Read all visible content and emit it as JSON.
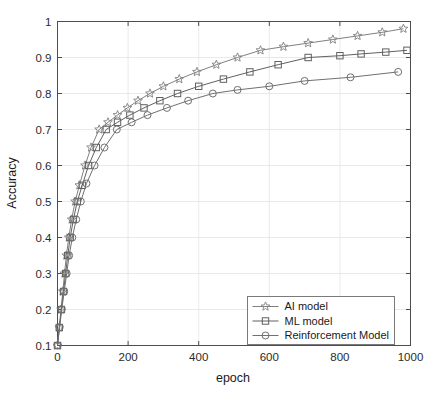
{
  "chart_data": {
    "type": "line",
    "title": "",
    "xlabel": "epoch",
    "ylabel": "Accuracy",
    "xlim": [
      0,
      1000
    ],
    "ylim": [
      0.1,
      1.0
    ],
    "xticks": [
      0,
      200,
      400,
      600,
      800,
      1000
    ],
    "xtick_labels": [
      "0",
      "200",
      "400",
      "600",
      "800",
      "1000"
    ],
    "yticks": [
      0.1,
      0.2,
      0.3,
      0.4,
      0.5,
      0.6,
      0.7,
      0.8,
      0.9,
      1.0
    ],
    "ytick_labels": [
      "0.1",
      "0.2",
      "0.3",
      "0.4",
      "0.5",
      "0.6",
      "0.7",
      "0.8",
      "0.9",
      "1"
    ],
    "grid": true,
    "legend_position": "lower right",
    "series": [
      {
        "name": "AI model",
        "marker": "star",
        "color": "#808080",
        "x": [
          0,
          5,
          10,
          15,
          20,
          25,
          32,
          40,
          50,
          62,
          78,
          95,
          118,
          143,
          170,
          198,
          228,
          262,
          300,
          345,
          395,
          450,
          510,
          575,
          640,
          710,
          780,
          850,
          920,
          980
        ],
        "values": [
          0.1,
          0.15,
          0.2,
          0.25,
          0.3,
          0.35,
          0.4,
          0.45,
          0.5,
          0.545,
          0.6,
          0.65,
          0.7,
          0.72,
          0.74,
          0.76,
          0.78,
          0.8,
          0.82,
          0.84,
          0.86,
          0.88,
          0.9,
          0.92,
          0.93,
          0.94,
          0.95,
          0.96,
          0.97,
          0.98
        ]
      },
      {
        "name": "ML model",
        "marker": "square",
        "color": "#606060",
        "x": [
          0,
          5,
          11,
          17,
          23,
          29,
          36,
          45,
          56,
          70,
          88,
          110,
          138,
          170,
          205,
          245,
          290,
          340,
          400,
          470,
          545,
          625,
          710,
          800,
          860,
          930,
          990
        ],
        "values": [
          0.1,
          0.15,
          0.2,
          0.25,
          0.3,
          0.35,
          0.4,
          0.45,
          0.5,
          0.545,
          0.6,
          0.65,
          0.7,
          0.72,
          0.74,
          0.76,
          0.78,
          0.8,
          0.82,
          0.84,
          0.86,
          0.88,
          0.9,
          0.905,
          0.91,
          0.915,
          0.92
        ]
      },
      {
        "name": "Reinforcement Model",
        "marker": "circle",
        "color": "#707070",
        "x": [
          0,
          6,
          12,
          19,
          26,
          33,
          42,
          53,
          66,
          82,
          105,
          133,
          168,
          210,
          255,
          310,
          370,
          440,
          510,
          600,
          700,
          830,
          965
        ],
        "values": [
          0.1,
          0.15,
          0.2,
          0.25,
          0.3,
          0.35,
          0.4,
          0.45,
          0.5,
          0.55,
          0.6,
          0.65,
          0.7,
          0.72,
          0.74,
          0.76,
          0.78,
          0.8,
          0.81,
          0.82,
          0.835,
          0.845,
          0.86
        ]
      }
    ]
  },
  "legend": {
    "entries": [
      {
        "label": "AI model"
      },
      {
        "label": "ML model"
      },
      {
        "label": "Reinforcement Model"
      }
    ]
  },
  "colors": {
    "axis": "#4d4d4d",
    "grid": "#e3e3e3",
    "background": "#ffffff",
    "text": "#1a1a1a"
  }
}
